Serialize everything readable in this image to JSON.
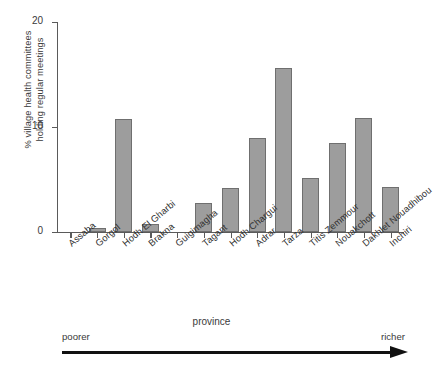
{
  "chart_data": {
    "type": "bar",
    "title": "",
    "xlabel": "province",
    "ylabel": "% village health committees holding regular meetings",
    "ylabel_line1": "% village health committees",
    "ylabel_line2": "holding regular meetings",
    "ylim": [
      0,
      20
    ],
    "yticks": [
      0,
      10,
      20
    ],
    "ytick_labels": [
      "0",
      "10",
      "20"
    ],
    "grid": false,
    "legend": null,
    "bar_color": "#9d9d9d",
    "bar_edge_color": "#6f6f6f",
    "categories": [
      "Assaba",
      "Gorgol",
      "Hodh El Gharbi",
      "Brakna",
      "Guigimagha",
      "Tagant",
      "Hodh Chargui",
      "Adrar",
      "Tarza",
      "Titis Zemmour",
      "Nouakchott",
      "Dakhlet Nouadhibou",
      "Inchiri"
    ],
    "values": [
      0,
      0.4,
      10.8,
      0.8,
      0,
      2.8,
      4.2,
      9.0,
      15.6,
      5.1,
      8.5,
      10.9,
      4.3
    ],
    "annotations": {
      "left_end": "poorer",
      "right_end": "richer",
      "arrow": "left-to-right arrow indicating increasing wealth"
    }
  }
}
